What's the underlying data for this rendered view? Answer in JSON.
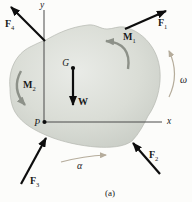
{
  "figure": {
    "caption": "(a)",
    "axes": {
      "x_label": "x",
      "y_label": "y"
    },
    "points": [
      {
        "id": "G",
        "label": "G"
      },
      {
        "id": "P",
        "label": "P"
      }
    ],
    "forces": [
      {
        "id": "F1",
        "symbol": "F",
        "sub": "1"
      },
      {
        "id": "F2",
        "symbol": "F",
        "sub": "2"
      },
      {
        "id": "F3",
        "symbol": "F",
        "sub": "3"
      },
      {
        "id": "F4",
        "symbol": "F",
        "sub": "4"
      }
    ],
    "moments": [
      {
        "id": "M1",
        "symbol": "M",
        "sub": "1"
      },
      {
        "id": "M2",
        "symbol": "M",
        "sub": "2"
      }
    ],
    "weight": {
      "symbol": "W"
    },
    "motion": {
      "angular_velocity": "ω",
      "angular_acceleration": "α"
    }
  },
  "colors": {
    "background": "#fcfcfa",
    "body-fill-light": "#e9ebe7",
    "body-fill-mid": "#daddd6",
    "body-fill-dark": "#c6cac3",
    "body-edge": "#b4b8b0",
    "axis": "#4b4b4b",
    "force": "#0d0d0d",
    "moment": "#8d9189",
    "motion": "#b5ac9b",
    "text": "#1a1a1a"
  }
}
